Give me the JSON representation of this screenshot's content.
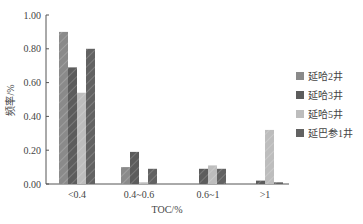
{
  "chart_data": {
    "type": "bar",
    "title": "",
    "xlabel": "TOC/%",
    "ylabel": "频率/%",
    "ylim": [
      0,
      1.0
    ],
    "yticks": [
      "0.00",
      "0.20",
      "0.40",
      "0.60",
      "0.80",
      "1.00"
    ],
    "categories": [
      "<0.4",
      "0.4~0.6",
      "0.6~1",
      ">1"
    ],
    "series": [
      {
        "name": "延哈2井",
        "color": "#8a8a8a",
        "values": [
          0.9,
          0.1,
          0.0,
          0.0
        ]
      },
      {
        "name": "延哈3井",
        "color": "#5c5c5c",
        "values": [
          0.69,
          0.19,
          0.09,
          0.02
        ]
      },
      {
        "name": "延哈5井",
        "color": "#bdbdbd",
        "values": [
          0.54,
          0.01,
          0.11,
          0.32
        ]
      },
      {
        "name": "延巴参1井",
        "color": "#626262",
        "values": [
          0.8,
          0.09,
          0.09,
          0.01
        ]
      }
    ],
    "grid": false,
    "legend_position": "right"
  }
}
